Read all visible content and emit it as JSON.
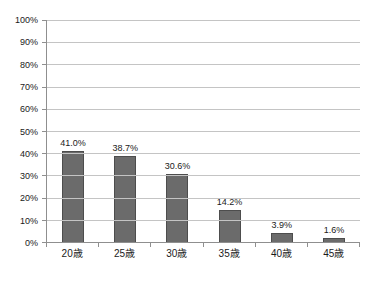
{
  "chart_data": {
    "type": "bar",
    "categories": [
      "20歳",
      "25歳",
      "30歳",
      "35歳",
      "40歳",
      "45歳"
    ],
    "values": [
      41.0,
      38.7,
      30.6,
      14.2,
      3.9,
      1.6
    ],
    "value_labels": [
      "41.0%",
      "38.7%",
      "30.6%",
      "14.2%",
      "3.9%",
      "1.6%"
    ],
    "title": "",
    "xlabel": "",
    "ylabel": "",
    "ylim": [
      0,
      100
    ],
    "ytick_step": 10,
    "ytick_labels": [
      "0%",
      "10%",
      "20%",
      "30%",
      "40%",
      "50%",
      "60%",
      "70%",
      "80%",
      "90%",
      "100%"
    ],
    "grid": true,
    "legend": "none",
    "colors": {
      "bar_fill": "#6b6b6b",
      "bar_border": "#4d4d4d",
      "gridline": "#c4c4c4",
      "axis": "#8f8f8f",
      "text": "#1a1a1a",
      "background": "#ffffff"
    }
  }
}
